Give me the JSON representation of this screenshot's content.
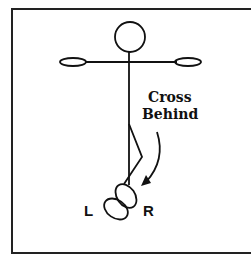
{
  "diagram": {
    "caption_line1": "Cross",
    "caption_line2": "Behind",
    "left_foot_label": "L",
    "right_foot_label": "R",
    "stroke_color": "#111111",
    "background_color": "#ffffff"
  }
}
